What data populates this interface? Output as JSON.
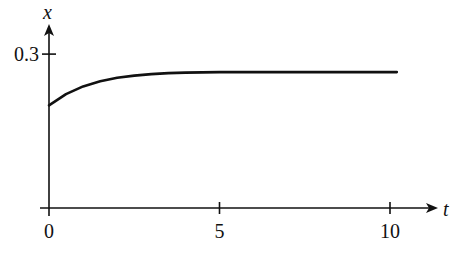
{
  "chart_data": {
    "type": "line",
    "title": "",
    "xlabel": "t",
    "ylabel": "x",
    "xlim": [
      0,
      11.5
    ],
    "ylim": [
      0,
      0.32
    ],
    "x_ticks": [
      0,
      5,
      10
    ],
    "x_tick_labels": [
      "0",
      "5",
      "10"
    ],
    "y_ticks": [
      0.3
    ],
    "y_tick_labels": [
      "0.3"
    ],
    "grid": false,
    "legend": null,
    "series": [
      {
        "name": "x(t)",
        "x": [
          0,
          0.5,
          1,
          1.5,
          2,
          2.5,
          3,
          3.5,
          4,
          5,
          6,
          7,
          8,
          9,
          10.2
        ],
        "y": [
          0.2,
          0.222,
          0.237,
          0.247,
          0.254,
          0.258,
          0.261,
          0.263,
          0.264,
          0.265,
          0.265,
          0.265,
          0.265,
          0.265,
          0.265
        ]
      }
    ],
    "line_color": "#111111"
  }
}
